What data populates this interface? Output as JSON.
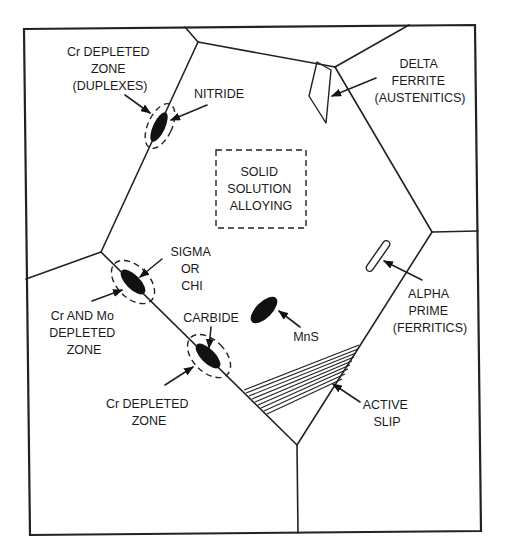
{
  "diagram": {
    "type": "microstructure-schematic",
    "colors": {
      "ink": "#222222",
      "background": "#ffffff"
    },
    "labels": {
      "cr_depleted_duplexes": [
        "Cr DEPLETED",
        "ZONE",
        "(DUPLEXES)"
      ],
      "nitride": [
        "NITRIDE"
      ],
      "delta_ferrite": [
        "DELTA",
        "FERRITE",
        "(AUSTENITICS)"
      ],
      "solid_solution": [
        "SOLID",
        "SOLUTION",
        "ALLOYING"
      ],
      "sigma_chi": [
        "SIGMA",
        "OR",
        "CHI"
      ],
      "cr_mo_depleted": [
        "Cr AND Mo",
        "DEPLETED",
        "ZONE"
      ],
      "carbide": [
        "CARBIDE"
      ],
      "mns": [
        "MnS"
      ],
      "alpha_prime": [
        "ALPHA",
        "PRIME",
        "(FERRITICS)"
      ],
      "cr_depleted_zone": [
        "Cr DEPLETED",
        "ZONE"
      ],
      "active_slip": [
        "ACTIVE",
        "SLIP"
      ]
    },
    "features": [
      {
        "name": "nitride",
        "type": "precipitate",
        "location": "grain boundary"
      },
      {
        "name": "delta ferrite",
        "type": "second phase",
        "alloy_family": "austenitics"
      },
      {
        "name": "solid solution alloying",
        "type": "matrix"
      },
      {
        "name": "sigma or chi",
        "type": "intermetallic",
        "location": "grain boundary"
      },
      {
        "name": "carbide",
        "type": "precipitate",
        "location": "grain boundary"
      },
      {
        "name": "MnS",
        "type": "inclusion",
        "location": "grain interior"
      },
      {
        "name": "alpha prime",
        "type": "precipitate",
        "alloy_family": "ferritics"
      },
      {
        "name": "active slip",
        "type": "deformation band"
      }
    ]
  }
}
